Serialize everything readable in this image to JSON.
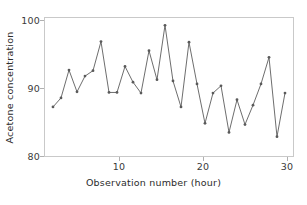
{
  "chart_data": {
    "type": "line",
    "title": "",
    "xlabel": "Observation number (hour)",
    "ylabel": "Acetone concentration",
    "xlim": [
      0.0,
      31.0
    ],
    "ylim": [
      78.2,
      101.0
    ],
    "xticks": [
      10,
      20,
      30
    ],
    "yticks": [
      80,
      90,
      100
    ],
    "grid": false,
    "legend": null,
    "marker": "circle",
    "line_color": "#6b6b6b",
    "marker_color": "#5a5a5a",
    "axis_color": "#c9c9c9",
    "background": "#ffffff",
    "x": [
      1,
      2,
      3,
      4,
      5,
      6,
      7,
      8,
      9,
      10,
      11,
      12,
      13,
      14,
      15,
      16,
      17,
      18,
      19,
      20,
      21,
      22,
      23,
      24,
      25,
      26,
      27,
      28,
      29,
      30
    ],
    "values": [
      86.3,
      87.8,
      92.4,
      88.8,
      91.4,
      92.3,
      97.1,
      88.7,
      88.7,
      93.0,
      90.4,
      88.6,
      95.6,
      90.8,
      99.8,
      90.6,
      86.3,
      97.0,
      90.1,
      83.6,
      88.6,
      89.8,
      82.1,
      87.5,
      83.4,
      86.6,
      90.1,
      94.5,
      81.4,
      88.6
    ],
    "series": [
      {
        "name": "Acetone concentration",
        "values": [
          86.3,
          87.8,
          92.4,
          88.8,
          91.4,
          92.3,
          97.1,
          88.7,
          88.7,
          93.0,
          90.4,
          88.6,
          95.6,
          90.8,
          99.8,
          90.6,
          86.3,
          97.0,
          90.1,
          83.6,
          88.6,
          89.8,
          82.1,
          87.5,
          83.4,
          86.6,
          90.1,
          94.5,
          81.4,
          88.6
        ]
      }
    ]
  },
  "axes": {
    "ytick_labels": [
      "100",
      "90",
      "80"
    ],
    "xtick_labels": [
      "10",
      "20",
      "30"
    ],
    "xlabel": "Observation number (hour)",
    "ylabel": "Acetone concentration"
  }
}
